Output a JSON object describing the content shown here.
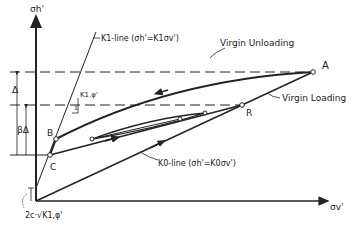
{
  "diagram": {
    "axes": {
      "y_label": "σh'",
      "x_label": "σv'"
    },
    "lines": {
      "k1_line": "K1-line (σh'=K1σv')",
      "k0_line": "K0-line (σh'=K0σv')",
      "virgin_unloading": "Virgin Unloading",
      "virgin_loading": "Virgin Loading"
    },
    "points": {
      "A": "A",
      "R": "R",
      "B": "B",
      "C": "C"
    },
    "annotations": {
      "delta": "Δ",
      "beta_delta": "βΔ",
      "slope_label": "K1,φ'",
      "slope_run": "1",
      "intercept": "2c·√K1,φ'"
    },
    "colors": {
      "ink": "#222222",
      "background": "#ffffff"
    }
  }
}
